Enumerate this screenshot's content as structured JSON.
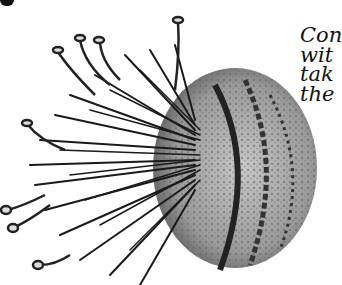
{
  "illustration": {
    "subject": "spiny-creature-illustration",
    "colors": {
      "ink": "#111111",
      "body_shade": "#8a8a8a",
      "background": "#ffffff"
    }
  },
  "caption": {
    "lines": [
      "Con",
      "wit",
      "tak",
      "the"
    ]
  }
}
